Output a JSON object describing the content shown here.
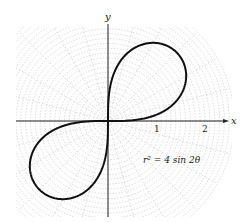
{
  "figure": {
    "equation_label": "r² = 4 sin 2θ",
    "axes": {
      "x_label": "x",
      "y_label": "y",
      "x_ticks": [
        {
          "value": 1,
          "label": "1"
        },
        {
          "value": 2,
          "label": "2"
        }
      ]
    },
    "curve": {
      "type": "lemniscate",
      "equation": "r^2 = 4 sin(2θ)",
      "a_squared": 4,
      "color": "#111111"
    },
    "grid": {
      "type": "polar",
      "ring_step": 0.1,
      "max_radius": 2.6,
      "ray_step_deg": 15,
      "color": "#b8b8b8"
    },
    "layout": {
      "origin_px": [
        108,
        121
      ],
      "unit_px": 48.5
    }
  }
}
